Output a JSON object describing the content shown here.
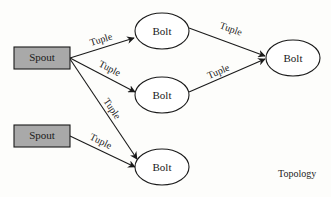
{
  "diagram": {
    "caption": "Topology",
    "colors": {
      "spout_fill": "#a9a9a9",
      "stroke": "#1a1a1a",
      "background": "#fdfdfb"
    },
    "nodes": [
      {
        "id": "spout1",
        "type": "spout",
        "label": "Spout",
        "x": 14,
        "y": 47,
        "w": 56,
        "h": 22
      },
      {
        "id": "spout2",
        "type": "spout",
        "label": "Spout",
        "x": 14,
        "y": 125,
        "w": 56,
        "h": 22
      },
      {
        "id": "bolt_top",
        "type": "bolt",
        "label": "Bolt",
        "cx": 162,
        "cy": 31,
        "rx": 27,
        "ry": 18
      },
      {
        "id": "bolt_mid",
        "type": "bolt",
        "label": "Bolt",
        "cx": 162,
        "cy": 95,
        "rx": 27,
        "ry": 18
      },
      {
        "id": "bolt_bot",
        "type": "bolt",
        "label": "Bolt",
        "cx": 162,
        "cy": 167,
        "rx": 27,
        "ry": 18
      },
      {
        "id": "bolt_right",
        "type": "bolt",
        "label": "Bolt",
        "cx": 293,
        "cy": 58,
        "rx": 27,
        "ry": 18
      }
    ],
    "edges": [
      {
        "from": "spout1",
        "to": "bolt_top",
        "label": "Tuple"
      },
      {
        "from": "spout1",
        "to": "bolt_mid",
        "label": "Tuple"
      },
      {
        "from": "spout1",
        "to": "bolt_bot",
        "label": "Tuple"
      },
      {
        "from": "spout2",
        "to": "bolt_bot",
        "label": "Tuple"
      },
      {
        "from": "bolt_top",
        "to": "bolt_right",
        "label": "Tuple"
      },
      {
        "from": "bolt_mid",
        "to": "bolt_right",
        "label": "Tuple"
      }
    ]
  }
}
